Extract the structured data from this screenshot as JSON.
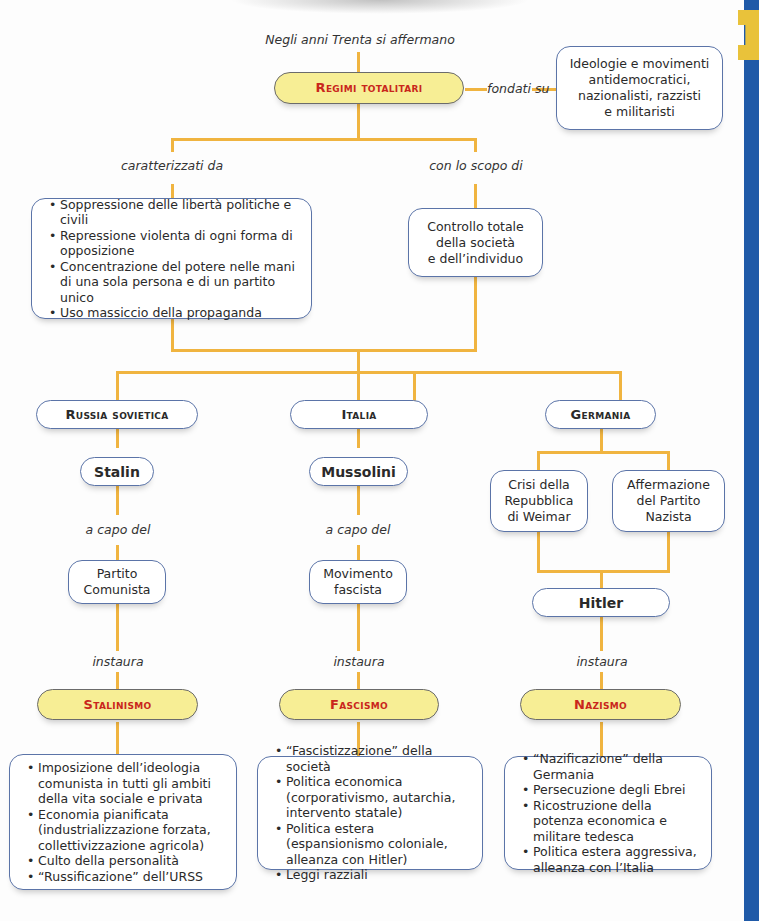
{
  "intro": "Negli anni Trenta si affermano",
  "root": {
    "title": "Regimi totalitari"
  },
  "foundation": {
    "connector": "fondati su",
    "text_lines": [
      "Ideologie e movimenti",
      "antidemocratici,",
      "nazionalisti, razzisti",
      "e militaristi"
    ]
  },
  "characteristics": {
    "connector": "caratterizzati da",
    "items": [
      "Soppressione delle libertà politiche e civili",
      "Repressione violenta di ogni forma di opposizione",
      "Concentrazione del potere nelle mani di una sola persona e di un partito unico",
      "Uso massiccio della propaganda"
    ]
  },
  "purpose": {
    "connector": "con lo scopo di",
    "text_lines": [
      "Controllo totale",
      "della società",
      "e dell’individuo"
    ]
  },
  "countries": [
    {
      "name": "Russia sovietica",
      "leader": "Stalin",
      "leader_connector": "a capo del",
      "party_lines": [
        "Partito",
        "Comunista"
      ],
      "regime_connector": "instaura",
      "regime": "Stalinismo",
      "features": [
        "Imposizione dell’ideologia comunista in tutti gli ambiti della vita sociale e privata",
        "Economia pianificata (industrializzazione forzata, collettivizzazione agricola)",
        "Culto della personalità",
        "“Russificazione” dell’URSS"
      ]
    },
    {
      "name": "Italia",
      "leader": "Mussolini",
      "leader_connector": "a capo del",
      "party_lines": [
        "Movimento",
        "fascista"
      ],
      "regime_connector": "instaura",
      "regime": "Fascismo",
      "features": [
        "“Fascistizzazione” della società",
        "Politica economica (corporativismo, autarchia, intervento statale)",
        "Politica estera (espansionismo coloniale, alleanza con Hitler)",
        "Leggi razziali"
      ]
    },
    {
      "name": "Germania",
      "causes": [
        {
          "lines": [
            "Crisi della",
            "Repubblica",
            "di Weimar"
          ]
        },
        {
          "lines": [
            "Affermazione",
            "del Partito",
            "Nazista"
          ]
        }
      ],
      "leader": "Hitler",
      "regime_connector": "instaura",
      "regime": "Nazismo",
      "features": [
        "“Nazificazione” della Germania",
        "Persecuzione degli Ebrei",
        "Ricostruzione della potenza economica e militare tedesca",
        "Politica estera aggressiva, alleanza con l’Italia"
      ]
    }
  ],
  "colors": {
    "connector_line": "#f0b440",
    "box_border": "#5b74a8",
    "highlight_fill": "#f7ee95",
    "highlight_text": "#c9261c",
    "side_bar": "#1f5aa8",
    "side_tab": "#e9c23a"
  }
}
